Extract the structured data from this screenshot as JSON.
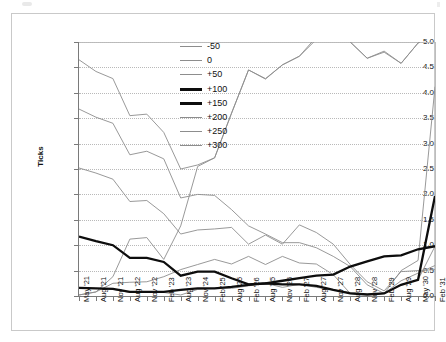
{
  "figure": {
    "ylabel": "Ticks"
  },
  "chart_data": {
    "type": "line",
    "title": "",
    "xlabel": "",
    "ylabel": "Ticks",
    "ylim": [
      0.0,
      5.0
    ],
    "ytick_labels": [
      "0.0",
      "0.5",
      "1.0",
      "1.5",
      "2.0",
      "2.5",
      "3.0",
      "3.5",
      "4.0",
      "4.5",
      "5.0"
    ],
    "ytick_values": [
      0.0,
      0.5,
      1.0,
      1.5,
      2.0,
      2.5,
      3.0,
      3.5,
      4.0,
      4.5,
      5.0
    ],
    "grid": true,
    "legend_position": "upper-center-left",
    "categories": [
      "May '21",
      "Aug '21",
      "Nov '21",
      "Aug '22",
      "Nov '22",
      "Feb '23",
      "Aug '23",
      "Nov '24",
      "Feb '25",
      "Aug '25",
      "Feb '26",
      "Aug '25",
      "Nov '26",
      "Feb '27",
      "Aug '27",
      "Nov '27",
      "Aug '28",
      "Nov '28",
      "Feb '29",
      "Aug '29",
      "May '30",
      "Feb '31"
    ],
    "series": [
      {
        "name": "-50",
        "style": "thin",
        "color": "#8d8d8d",
        "values": [
          4.65,
          4.42,
          4.28,
          3.55,
          3.58,
          3.22,
          2.5,
          2.58,
          2.72,
          3.6,
          4.45,
          4.27,
          4.55,
          4.72,
          5.1,
          5.4,
          5.0,
          4.68,
          4.8,
          4.58,
          4.98,
          5.2
        ]
      },
      {
        "name": "0",
        "style": "thin",
        "color": "#8d8d8d",
        "values": [
          0.16,
          0.15,
          0.13,
          0.07,
          0.07,
          0.07,
          0.02,
          0.13,
          0.15,
          0.15,
          0.2,
          0.25,
          0.17,
          0.23,
          0.17,
          0.12,
          0.07,
          0.03,
          0.05,
          0.22,
          0.32,
          0.98
        ]
      },
      {
        "name": "+50",
        "style": "thin",
        "color": "#8d8d8d",
        "values": [
          3.68,
          3.52,
          3.4,
          2.78,
          2.85,
          2.7,
          1.93,
          2.0,
          1.98,
          1.7,
          1.38,
          1.22,
          1.05,
          1.05,
          0.95,
          0.78,
          0.58,
          0.22,
          0.05,
          0.3,
          0.45,
          0.6
        ]
      },
      {
        "name": "+100",
        "style": "thick",
        "color": "#0d0d0d",
        "values": [
          1.17,
          1.08,
          1.0,
          0.75,
          0.75,
          0.67,
          0.4,
          0.48,
          0.48,
          0.35,
          0.23,
          0.25,
          0.23,
          0.23,
          0.2,
          0.12,
          0.05,
          0.03,
          0.05,
          0.22,
          0.32,
          1.97
        ]
      },
      {
        "name": "+150",
        "style": "thick",
        "color": "#0d0d0d",
        "values": [
          0.16,
          0.15,
          0.14,
          0.08,
          0.08,
          0.08,
          0.12,
          0.15,
          0.15,
          0.18,
          0.22,
          0.25,
          0.3,
          0.35,
          0.4,
          0.42,
          0.58,
          0.68,
          0.78,
          0.8,
          0.92,
          0.98
        ]
      },
      {
        "name": "+200",
        "style": "thin",
        "color": "#8d8d8d",
        "values": [
          2.52,
          2.42,
          2.3,
          1.86,
          1.88,
          1.62,
          1.22,
          1.3,
          1.32,
          1.35,
          1.02,
          1.2,
          1.02,
          1.4,
          1.25,
          1.02,
          0.62,
          0.28,
          0.1,
          0.48,
          0.5,
          0.52
        ]
      },
      {
        "name": "+250",
        "style": "thin",
        "color": "#8d8d8d",
        "values": [
          0.02,
          0.08,
          0.38,
          1.12,
          1.15,
          0.72,
          1.38,
          2.55,
          2.72,
          3.6,
          4.45,
          4.28,
          4.55,
          4.72,
          5.05,
          5.35,
          5.0,
          4.68,
          4.82,
          4.58,
          4.98,
          5.2
        ]
      },
      {
        "name": "+300",
        "style": "thin",
        "color": "#8d8d8d",
        "values": [
          0.02,
          0.08,
          0.25,
          0.27,
          0.28,
          0.38,
          0.52,
          0.62,
          0.72,
          0.63,
          0.78,
          0.62,
          0.78,
          0.65,
          0.63,
          0.42,
          0.05,
          0.03,
          0.05,
          0.5,
          0.7,
          4.12
        ]
      }
    ]
  }
}
